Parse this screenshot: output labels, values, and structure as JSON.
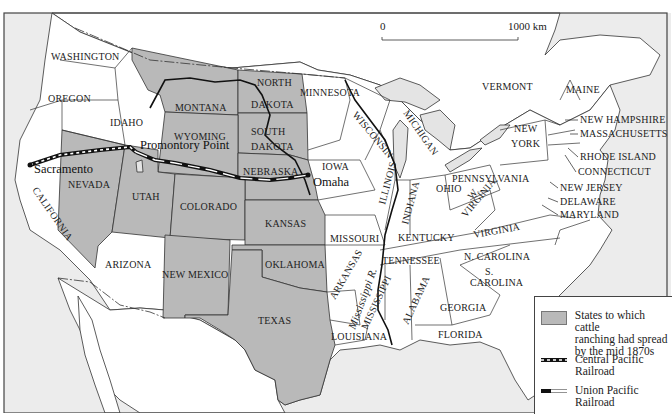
{
  "map": {
    "scale_bar": {
      "start_label": "0",
      "end_label": "1000 km"
    },
    "states_cattle": [
      "MONTANA",
      "NORTH DAKOTA",
      "SOUTH DAKOTA",
      "WYOMING",
      "NEBRASKA",
      "NEVADA",
      "UTAH",
      "COLORADO",
      "KANSAS",
      "NEW MEXICO",
      "OKLAHOMA",
      "TEXAS"
    ],
    "labels": {
      "washington": "WASHINGTON",
      "oregon": "OREGON",
      "idaho": "IDAHO",
      "california": "CALIFORNIA",
      "nevada": "NEVADA",
      "utah": "UTAH",
      "arizona": "ARIZONA",
      "montana": "MONTANA",
      "wyoming": "WYOMING",
      "colorado": "COLORADO",
      "new_mexico": "NEW MEXICO",
      "north": "NORTH",
      "dakota_n": "DAKOTA",
      "south": "SOUTH",
      "dakota_s": "DAKOTA",
      "nebraska": "NEBRASKA",
      "kansas": "KANSAS",
      "oklahoma": "OKLAHOMA",
      "texas": "TEXAS",
      "minnesota": "MINNESOTA",
      "iowa": "IOWA",
      "missouri": "MISSOURI",
      "arkansas": "ARKANSAS",
      "louisiana": "LOUISIANA",
      "wisconsin": "WISCONSIN",
      "illinois": "ILLINOIS",
      "michigan": "MICHIGAN",
      "indiana": "INDIANA",
      "ohio": "OHIO",
      "kentucky": "KENTUCKY",
      "tennessee": "TENNESSEE",
      "mississippi": "MISSISSIPPI",
      "alabama": "ALABAMA",
      "georgia": "GEORGIA",
      "florida": "FLORIDA",
      "w": "W.",
      "virginia_w": "VIRGINIA",
      "virginia": "VIRGINIA",
      "n_carolina": "N. CAROLINA",
      "s": "S.",
      "carolina": "CAROLINA",
      "pennsylvania": "PENNSYLVANIA",
      "new": "NEW",
      "york": "YORK",
      "vermont": "VERMONT",
      "maine": "MAINE",
      "new_hampshire": "NEW HAMPSHIRE",
      "massachusetts": "MASSACHUSETTS",
      "rhode_island": "RHODE ISLAND",
      "connecticut": "CONNECTICUT",
      "new_jersey": "NEW JERSEY",
      "delaware": "DELAWARE",
      "maryland": "MARYLAND",
      "mississippi_r": "Mississippi R."
    },
    "cities": {
      "sacramento": "Sacramento",
      "promontory": "Promontory Point",
      "omaha": "Omaha"
    },
    "colors": {
      "cattle_fill": "#b9b9b9",
      "water": "#ececec",
      "land": "#ffffff"
    }
  },
  "legend": {
    "items": [
      {
        "label_line1": "States to which cattle",
        "label_line2": "ranching had spread",
        "label_line3": "by the mid 1870s"
      },
      {
        "label_line1": "Central Pacific",
        "label_line2": "Railroad"
      },
      {
        "label_line1": "Union Pacific",
        "label_line2": "Railroad"
      }
    ]
  }
}
